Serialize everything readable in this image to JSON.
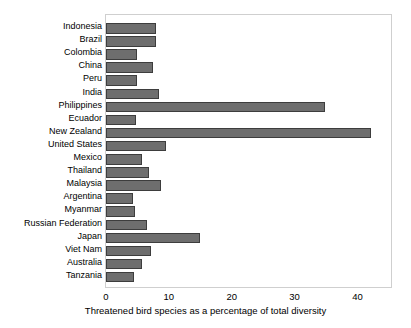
{
  "chart_data": {
    "type": "bar",
    "orientation": "horizontal",
    "title": "",
    "xlabel": "Threatened bird species as a percentage of total diversity",
    "ylabel": "",
    "xlim": [
      0,
      45.5
    ],
    "xticks": [
      0,
      10,
      20,
      30,
      40
    ],
    "xtick_labels": [
      "0",
      "10",
      "20",
      "30",
      "40"
    ],
    "grid": false,
    "legend": null,
    "bar_fill_color": "#6e6e6e",
    "bar_edge_color": "#3d3d3d",
    "frame_color": "#cfcfcf",
    "categories": [
      "Indonesia",
      "Brazil",
      "Colombia",
      "China",
      "Peru",
      "India",
      "Philippines",
      "Ecuador",
      "New Zealand",
      "United States",
      "Mexico",
      "Thailand",
      "Malaysia",
      "Argentina",
      "Myanmar",
      "Russian Federation",
      "Japan",
      "Viet Nam",
      "Australia",
      "Tanzania"
    ],
    "values": [
      7.9,
      7.9,
      4.9,
      7.4,
      4.9,
      8.5,
      34.9,
      4.8,
      42.1,
      9.6,
      5.7,
      6.9,
      8.7,
      4.3,
      4.6,
      6.6,
      14.9,
      7.1,
      5.8,
      4.5
    ]
  }
}
